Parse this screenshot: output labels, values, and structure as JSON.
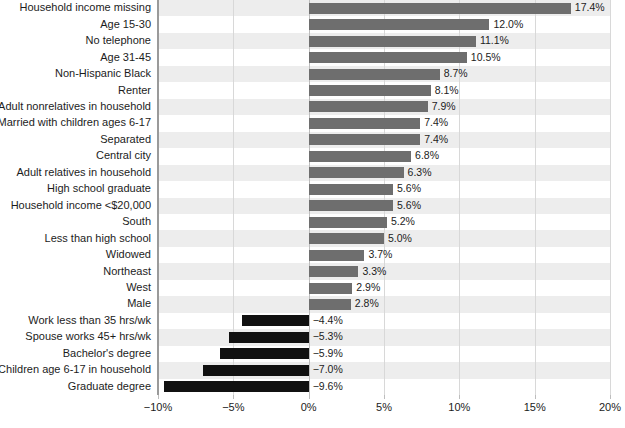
{
  "chart_data": {
    "type": "bar",
    "orientation": "horizontal",
    "title": "",
    "subtitle": "",
    "xlabel": "",
    "ylabel": "",
    "xlim": [
      -10,
      20
    ],
    "grid": true,
    "legend": null,
    "xticks": [
      -10,
      -5,
      0,
      5,
      10,
      15,
      20
    ],
    "xtick_labels": [
      "−10%",
      "−5%",
      "0%",
      "5%",
      "10%",
      "15%",
      "20%"
    ],
    "colors": {
      "positive_bar": "#6e6e6e",
      "negative_bar": "#111111",
      "row_band": "#ededed",
      "gridline": "#d8d8d8",
      "axis": "#9a9a9a",
      "text": "#1c1c1c",
      "background": "#ffffff"
    },
    "categories": [
      "Household income missing",
      "Age 15-30",
      "No telephone",
      "Age 31-45",
      "Non-Hispanic Black",
      "Renter",
      "Adult nonrelatives in household",
      "Married with children ages 6-17",
      "Separated",
      "Central city",
      "Adult relatives in household",
      "High school graduate",
      "Household income <$20,000",
      "South",
      "Less than high school",
      "Widowed",
      "Northeast",
      "West",
      "Male",
      "Work less than 35 hrs/wk",
      "Spouse works 45+ hrs/wk",
      "Bachelor's degree",
      "Children age 6-17 in household",
      "Graduate degree"
    ],
    "values": [
      17.4,
      12.0,
      11.1,
      10.5,
      8.7,
      8.1,
      7.9,
      7.4,
      7.4,
      6.8,
      6.3,
      5.6,
      5.6,
      5.2,
      5.0,
      3.7,
      3.3,
      2.9,
      2.8,
      -4.4,
      -5.3,
      -5.9,
      -7.0,
      -9.6
    ],
    "value_labels": [
      "17.4%",
      "12.0%",
      "11.1%",
      "10.5%",
      "8.7%",
      "8.1%",
      "7.9%",
      "7.4%",
      "7.4%",
      "6.8%",
      "6.3%",
      "5.6%",
      "5.6%",
      "5.2%",
      "5.0%",
      "3.7%",
      "3.3%",
      "2.9%",
      "2.8%",
      "−4.4%",
      "−5.3%",
      "−5.9%",
      "−7.0%",
      "−9.6%"
    ]
  }
}
